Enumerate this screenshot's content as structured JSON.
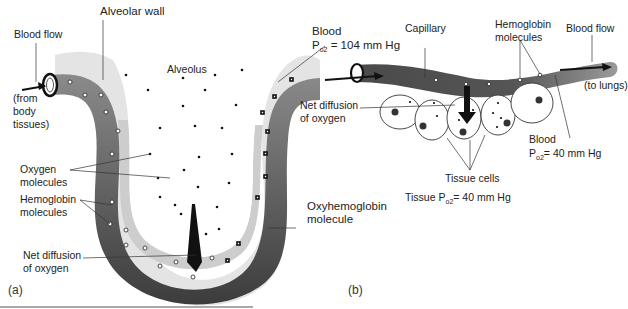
{
  "panel_a": {
    "tag": "(a)",
    "labels": {
      "blood_flow": "Blood flow",
      "from_body_l1": "(from",
      "from_body_l2": "body",
      "from_body_l3": "tissues)",
      "alveolar_wall": "Alveolar wall",
      "alveolus": "Alveolus",
      "oxygen_molecules_l1": "Oxygen",
      "oxygen_molecules_l2": "molecules",
      "hemoglobin_molecules_l1": "Hemoglobin",
      "hemoglobin_molecules_l2": "molecules",
      "net_diffusion_l1": "Net diffusion",
      "net_diffusion_l2": "of oxygen",
      "oxyhemoglobin_l1": "Oxyhemoglobin",
      "oxyhemoglobin_l2": "molecule",
      "blood_l1": "Blood",
      "blood_po2_prefix": "P",
      "blood_po2_sub": "o",
      "blood_po2_sub2": "2",
      "blood_po2_value": " = 104 mm Hg"
    }
  },
  "panel_b": {
    "tag": "(b)",
    "labels": {
      "capillary": "Capillary",
      "hemoglobin_molecules_l1": "Hemoglobin",
      "hemoglobin_molecules_l2": "molecules",
      "blood_flow": "Blood flow",
      "to_lungs": "(to lungs)",
      "net_diffusion_l1": "Net diffusion",
      "net_diffusion_l2": "of oxygen",
      "blood_l1": "Blood",
      "blood_po2_prefix": "P",
      "blood_po2_sub": "o",
      "blood_po2_sub2": "2",
      "blood_po2_value": "= 40 mm Hg",
      "tissue_cells": "Tissue cells",
      "tissue_po2_prefix": "Tissue P",
      "tissue_po2_sub": "o",
      "tissue_po2_sub2": "2",
      "tissue_po2_value": "= 40 mm Hg"
    }
  },
  "colors": {
    "blood_vessel": "#6e6e6e",
    "blood_vessel_dark": "#3a3a3a",
    "alveolar_wall": "#c8c8c8",
    "alveolar_wall_outer": "#e2e2e2",
    "arrow": "#111111",
    "text": "#222222"
  }
}
